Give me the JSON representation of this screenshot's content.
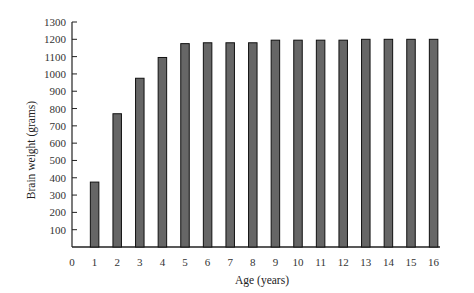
{
  "chart_data": {
    "type": "bar",
    "title": "",
    "xlabel": "Age (years)",
    "ylabel": "Brain weight (grams)",
    "categories": [
      "1",
      "2",
      "3",
      "4",
      "5",
      "6",
      "7",
      "8",
      "9",
      "10",
      "11",
      "12",
      "13",
      "14",
      "15",
      "16"
    ],
    "values": [
      375,
      770,
      975,
      1095,
      1175,
      1180,
      1180,
      1180,
      1195,
      1195,
      1195,
      1195,
      1200,
      1200,
      1200,
      1200
    ],
    "x_ticks": [
      "0",
      "1",
      "2",
      "3",
      "4",
      "5",
      "6",
      "7",
      "8",
      "9",
      "10",
      "11",
      "12",
      "13",
      "14",
      "15",
      "16"
    ],
    "y_ticks": [
      100,
      200,
      300,
      400,
      500,
      600,
      700,
      800,
      900,
      1000,
      1100,
      1200,
      1300
    ],
    "ylim": [
      0,
      1300
    ],
    "xlim": [
      0,
      16
    ],
    "grid": false,
    "legend": null,
    "bar_color": "#666666",
    "bar_edge_color": "#111111"
  }
}
